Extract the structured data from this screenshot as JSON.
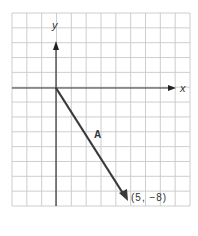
{
  "figure": {
    "axes": {
      "x_label": "x",
      "y_label": "y"
    },
    "vector": {
      "label": "A",
      "start": [
        0,
        0
      ],
      "end": [
        5,
        -8
      ],
      "endpoint_label": "(5, −8)"
    },
    "grid": {
      "x_min": -3,
      "x_max": 9,
      "y_min": -8,
      "y_max": 5
    }
  },
  "colors": {
    "grid": "#c8c8c8",
    "axis": "#333333",
    "vector": "#3a3a3a",
    "background": "#ffffff"
  }
}
